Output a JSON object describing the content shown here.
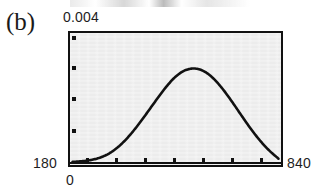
{
  "figure": {
    "panel_label": "(b)",
    "y_axis_top_label": "0.004",
    "x_axis_left_label": "180",
    "x_axis_right_label": "840",
    "origin_label": "0"
  },
  "chart_data": {
    "type": "line",
    "title": "",
    "subtitle": "",
    "xlabel": "",
    "ylabel": "",
    "xlim": [
      180,
      840
    ],
    "ylim": [
      0,
      0.004
    ],
    "grid": false,
    "legend": null,
    "annotations": [
      "(b)"
    ],
    "axis_tick_labels": {
      "x": [
        "180",
        "840"
      ],
      "y": [
        "0.004"
      ]
    },
    "x_tick_count": 7,
    "y_tick_count": 4,
    "series": [
      {
        "name": "density",
        "x": [
          180,
          210,
          240,
          270,
          300,
          330,
          360,
          390,
          420,
          450,
          480,
          510,
          540,
          570,
          600,
          630,
          660,
          690,
          720,
          750,
          780,
          810,
          840
        ],
        "values": [
          2e-05,
          4e-05,
          8e-05,
          0.00016,
          0.0003,
          0.00052,
          0.00082,
          0.00118,
          0.00158,
          0.00199,
          0.00238,
          0.0027,
          0.0029,
          0.00296,
          0.00288,
          0.00266,
          0.00233,
          0.00193,
          0.0015,
          0.00108,
          0.0007,
          0.00038,
          0.00012
        ]
      }
    ],
    "peak": {
      "x": 570,
      "y": 0.00296
    }
  }
}
